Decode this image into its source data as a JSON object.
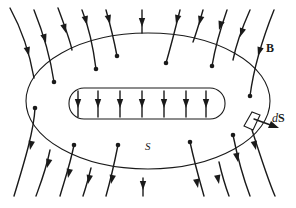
{
  "diagram": {
    "labels": {
      "field": "B",
      "surface": "S",
      "area_element_d": "d",
      "area_element_S": "S"
    },
    "colors": {
      "ink": "#1a1a1a",
      "background": "#ffffff"
    }
  }
}
